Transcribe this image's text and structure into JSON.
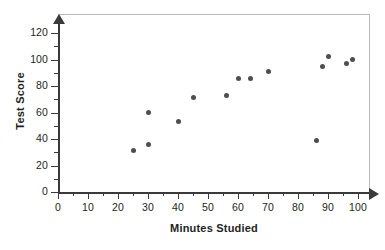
{
  "chart_data": {
    "type": "scatter",
    "title": "",
    "xlabel": "Minutes Studied",
    "ylabel": "Test Score",
    "xlim": [
      0,
      105
    ],
    "ylim": [
      0,
      127
    ],
    "grid": false,
    "legend": null,
    "x_ticks": [
      0,
      10,
      20,
      30,
      40,
      50,
      60,
      70,
      80,
      90,
      100
    ],
    "x_tick_labels": [
      "0",
      "10",
      "20",
      "30",
      "40",
      "50",
      "60",
      "70",
      "80",
      "90",
      "100"
    ],
    "x_minor_ticks": [
      5,
      15,
      25,
      35,
      45,
      55,
      65,
      75,
      85,
      95
    ],
    "y_ticks": [
      0,
      20,
      40,
      60,
      80,
      100,
      120
    ],
    "y_tick_labels": [
      "0",
      "20",
      "40",
      "60",
      "80",
      "100",
      "120"
    ],
    "y_minor_ticks": [
      10,
      30,
      50,
      70,
      90,
      110
    ],
    "point_color": "#4d4d52",
    "axis_color": "#3a3a3a",
    "frame_color": "#b9b9b9",
    "points": [
      {
        "x": 25,
        "y": 31
      },
      {
        "x": 30,
        "y": 36
      },
      {
        "x": 30,
        "y": 60
      },
      {
        "x": 40,
        "y": 53
      },
      {
        "x": 45,
        "y": 71
      },
      {
        "x": 56,
        "y": 73
      },
      {
        "x": 60,
        "y": 86
      },
      {
        "x": 64,
        "y": 86
      },
      {
        "x": 70,
        "y": 91
      },
      {
        "x": 86,
        "y": 39
      },
      {
        "x": 88,
        "y": 95
      },
      {
        "x": 90,
        "y": 102
      },
      {
        "x": 96,
        "y": 97
      },
      {
        "x": 98,
        "y": 100
      }
    ]
  }
}
